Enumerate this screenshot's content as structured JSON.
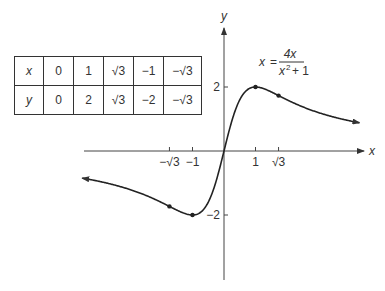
{
  "chart_data": {
    "type": "line",
    "title": "",
    "function_label": {
      "lhs": "x",
      "equals": "=",
      "numerator": "4x",
      "denominator_base": "x",
      "denominator_exp": "2",
      "denominator_rest": "+ 1"
    },
    "xlabel": "x",
    "ylabel": "y",
    "xlim": [
      -4.5,
      4.35
    ],
    "ylim": [
      -4.0,
      3.8
    ],
    "x_ticks": [
      {
        "value": -1.732,
        "label": "−√3"
      },
      {
        "value": -1,
        "label": "−1"
      },
      {
        "value": 1,
        "label": "1"
      },
      {
        "value": 1.732,
        "label": "√3"
      }
    ],
    "y_ticks": [
      {
        "value": 2,
        "label": "2"
      },
      {
        "value": -2,
        "label": "−2"
      }
    ],
    "series": [
      {
        "name": "y = 4x/(x^2+1)",
        "function": "4x/(x^2+1)",
        "x_range": [
          -4.5,
          4.3
        ]
      }
    ],
    "points": [
      {
        "x": 1,
        "y": 2
      },
      {
        "x": 1.732,
        "y": 1.732
      },
      {
        "x": -1,
        "y": -2
      },
      {
        "x": -1.732,
        "y": -1.732
      }
    ],
    "grid": false,
    "legend": "none"
  },
  "table": {
    "rows": [
      {
        "header": "x",
        "cells": [
          "0",
          "1",
          "√3",
          "−1",
          "−√3"
        ]
      },
      {
        "header": "y",
        "cells": [
          "0",
          "2",
          "√3",
          "−2",
          "−√3"
        ]
      }
    ]
  }
}
